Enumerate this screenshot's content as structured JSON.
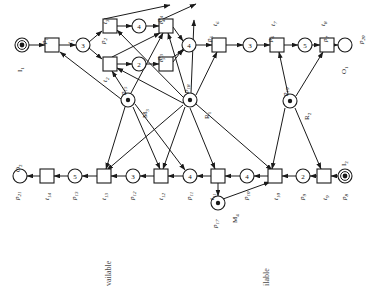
{
  "diagram": {
    "type": "petri-net",
    "colors": {
      "stroke": "#1a1a1a",
      "fill": "#ffffff",
      "text": "#111111",
      "caption": "#4a4a4a"
    }
  },
  "places": [
    {
      "id": "p1",
      "label": "p1",
      "sub": "1",
      "aux": "I1",
      "tokens": "dot",
      "cx": 22,
      "cy": 45
    },
    {
      "id": "p2",
      "label": "p2",
      "sub": "2",
      "aux": "",
      "tokens": "3",
      "cx": 83,
      "cy": 45
    },
    {
      "id": "p4",
      "label": "p4",
      "sub": "4",
      "aux": "",
      "tokens": "4",
      "cx": 139,
      "cy": 26
    },
    {
      "id": "p3",
      "label": "p3",
      "sub": "3",
      "aux": "",
      "tokens": "2",
      "cx": 139,
      "cy": 64
    },
    {
      "id": "p5",
      "label": "p5",
      "sub": "5",
      "aux": "",
      "tokens": "4",
      "cx": 189,
      "cy": 45
    },
    {
      "id": "p6",
      "label": "p6",
      "sub": "6",
      "aux": "",
      "tokens": "3",
      "cx": 250,
      "cy": 45
    },
    {
      "id": "p7",
      "label": "p7",
      "sub": "7",
      "aux": "",
      "tokens": "5",
      "cx": 305,
      "cy": 45
    },
    {
      "id": "p20",
      "label": "p20",
      "sub": "20",
      "aux": "O1",
      "tokens": "",
      "cx": 345,
      "cy": 45
    },
    {
      "id": "p15",
      "label": "p15",
      "sub": "15",
      "aux": "M3",
      "tokens": "dot",
      "cx": 128,
      "cy": 100
    },
    {
      "id": "p18",
      "label": "p18",
      "sub": "18",
      "aux": "R1",
      "tokens": "dot",
      "cx": 190,
      "cy": 100
    },
    {
      "id": "p19",
      "label": "p19",
      "sub": "19",
      "aux": "R2",
      "tokens": "dot",
      "cx": 290,
      "cy": 101
    },
    {
      "id": "p21",
      "label": "p21",
      "sub": "21",
      "aux": "O2",
      "tokens": "",
      "cx": 20,
      "cy": 176
    },
    {
      "id": "p13",
      "label": "p13",
      "sub": "13",
      "aux": "",
      "tokens": "5",
      "cx": 75,
      "cy": 176
    },
    {
      "id": "p12",
      "label": "p12",
      "sub": "12",
      "aux": "",
      "tokens": "3",
      "cx": 133,
      "cy": 176
    },
    {
      "id": "p11",
      "label": "p11",
      "sub": "11",
      "aux": "",
      "tokens": "4",
      "cx": 190,
      "cy": 176
    },
    {
      "id": "p10",
      "label": "p10",
      "sub": "10",
      "aux": "",
      "tokens": "4",
      "cx": 247,
      "cy": 176
    },
    {
      "id": "p9",
      "label": "p9",
      "sub": "9",
      "aux": "",
      "tokens": "2",
      "cx": 303,
      "cy": 176
    },
    {
      "id": "p8",
      "label": "p8",
      "sub": "8",
      "aux": "I2",
      "tokens": "dot",
      "cx": 345,
      "cy": 176
    },
    {
      "id": "p17",
      "label": "p17",
      "sub": "17",
      "aux": "M4",
      "tokens": "dot",
      "cx": 218,
      "cy": 203
    }
  ],
  "transitions": [
    {
      "id": "t1",
      "label": "t1",
      "sub": "1",
      "cx": 52,
      "cy": 45
    },
    {
      "id": "t3",
      "label": "t3",
      "sub": "3",
      "cx": 110,
      "cy": 26
    },
    {
      "id": "t2",
      "label": "t2",
      "sub": "2",
      "cx": 110,
      "cy": 64
    },
    {
      "id": "t4",
      "label": "t4",
      "sub": "4",
      "cx": 166,
      "cy": 26
    },
    {
      "id": "t5",
      "label": "t5",
      "sub": "5",
      "cx": 166,
      "cy": 64
    },
    {
      "id": "t6",
      "label": "t6",
      "sub": "6",
      "cx": 219,
      "cy": 45
    },
    {
      "id": "t7",
      "label": "t7",
      "sub": "7",
      "cx": 277,
      "cy": 45
    },
    {
      "id": "t8",
      "label": "t8",
      "sub": "8",
      "cx": 327,
      "cy": 45
    },
    {
      "id": "t14",
      "label": "t14",
      "sub": "14",
      "cx": 47,
      "cy": 176
    },
    {
      "id": "t13",
      "label": "t13",
      "sub": "13",
      "cx": 104,
      "cy": 176
    },
    {
      "id": "t12",
      "label": "t12",
      "sub": "12",
      "cx": 161,
      "cy": 176
    },
    {
      "id": "t11",
      "label": "t11",
      "sub": "11",
      "cx": 218,
      "cy": 176
    },
    {
      "id": "t10",
      "label": "t10",
      "sub": "10",
      "cx": 275,
      "cy": 176
    },
    {
      "id": "t9",
      "label": "t9",
      "sub": "9",
      "cx": 324,
      "cy": 176
    }
  ],
  "labels": {
    "p1": "p1",
    "p2": "p2",
    "p3": "p3",
    "p4": "p4",
    "p5": "p5",
    "p6": "p6",
    "p7": "p7",
    "p8": "p8",
    "p9": "p9",
    "p10": "p10",
    "p11": "p11",
    "p12": "p12",
    "p13": "p13",
    "p15": "p15",
    "p17": "p17",
    "p18": "p18",
    "p19": "p19",
    "p20": "p20",
    "p21": "p21",
    "t1": "t1",
    "t2": "t2",
    "t3": "t3",
    "t4": "t4",
    "t5": "t5",
    "t6": "t6",
    "t7": "t7",
    "t8": "t8",
    "t9": "t9",
    "t10": "t10",
    "t11": "t11",
    "t12": "t12",
    "t13": "t13",
    "t14": "t14",
    "I1": "I1",
    "I2": "I2",
    "O1": "O1",
    "O2": "O2",
    "M3": "M3",
    "M4": "M4",
    "R1": "R1",
    "R2": "R2"
  },
  "tokens": {
    "p2": "3",
    "p3": "2",
    "p4": "4",
    "p5": "4",
    "p6": "3",
    "p7": "5",
    "p9": "2",
    "p10": "4",
    "p11": "4",
    "p12": "3",
    "p13": "5"
  },
  "captions": [
    {
      "id": "caption-left",
      "text": "vailable",
      "x": 104,
      "y": 286
    },
    {
      "id": "caption-right",
      "text": "ilable",
      "x": 262,
      "y": 286
    }
  ]
}
